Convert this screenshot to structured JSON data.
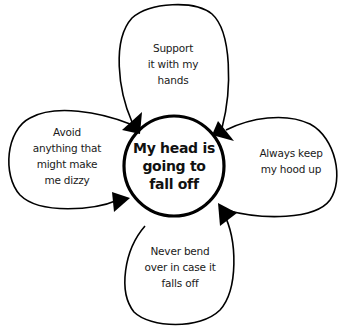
{
  "diagram": {
    "type": "vicious-flower",
    "center": {
      "lines": [
        "My head is",
        "going to",
        "fall off"
      ]
    },
    "petals": [
      {
        "position": "top",
        "lines": [
          "Support",
          "it with my",
          "hands"
        ]
      },
      {
        "position": "right",
        "lines": [
          "Always keep",
          "my hood up"
        ]
      },
      {
        "position": "bottom",
        "lines": [
          "Never bend",
          "over in case it",
          "falls off"
        ]
      },
      {
        "position": "left",
        "lines": [
          "Avoid",
          "anything that",
          "might make",
          "me dizzy"
        ]
      }
    ],
    "colors": {
      "stroke": "#000000",
      "background": "#ffffff",
      "text": "#1a1a1a"
    }
  }
}
